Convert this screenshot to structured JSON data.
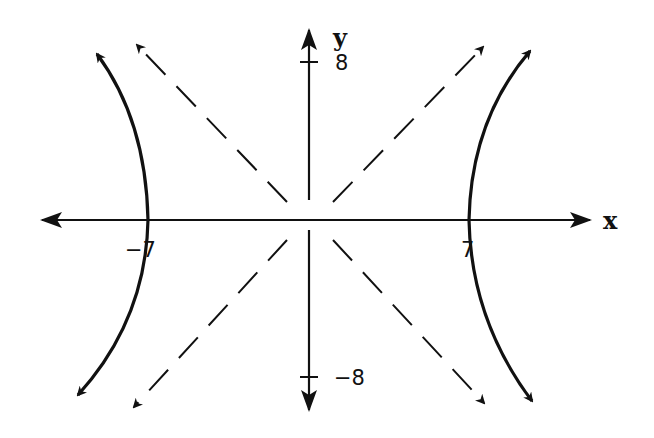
{
  "diagram": {
    "title": "",
    "type": "hyperbola graph",
    "colors": {
      "ink": "#111111",
      "background": "#ffffff"
    },
    "axes": {
      "x_label": "x",
      "y_label": "y",
      "x_ticks": [
        {
          "value": -7,
          "label": "−7"
        },
        {
          "value": 7,
          "label": "7"
        }
      ],
      "y_ticks": [
        {
          "value": 8,
          "label": "8"
        },
        {
          "value": -8,
          "label": "−8"
        }
      ]
    },
    "curves": [
      {
        "name": "hyperbola-left-branch",
        "style": "solid",
        "vertex": [
          -7,
          0
        ]
      },
      {
        "name": "hyperbola-right-branch",
        "style": "solid",
        "vertex": [
          7,
          0
        ]
      },
      {
        "name": "asymptote-positive-slope",
        "style": "dashed"
      },
      {
        "name": "asymptote-negative-slope",
        "style": "dashed"
      }
    ]
  }
}
